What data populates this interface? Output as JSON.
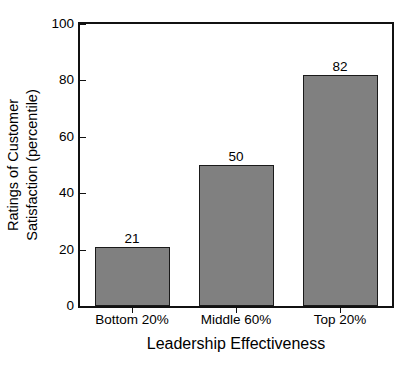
{
  "chart_data": {
    "type": "bar",
    "title": "",
    "categories": [
      "Bottom 20%",
      "Middle 60%",
      "Top 20%"
    ],
    "values": [
      21,
      50,
      82
    ],
    "value_labels": [
      "21",
      "50",
      "82"
    ],
    "xlabel": "Leadership Effectiveness",
    "ylabel_lines": [
      "Ratings of Customer",
      "Satisfaction (percentile)"
    ],
    "ylabel": "Ratings of Customer Satisfaction (percentile)",
    "ylim": [
      0,
      100
    ],
    "yticks": [
      0,
      20,
      40,
      60,
      80,
      100
    ],
    "ytick_labels": [
      "0",
      "20",
      "40",
      "60",
      "80",
      "100"
    ],
    "grid": false,
    "legend": false,
    "legend_position": "none",
    "bar_color": "#808080",
    "bar_edge_color": "#1a1a1a",
    "axis_color": "#111111",
    "background_color": "#ffffff",
    "text_color": "#000000"
  }
}
